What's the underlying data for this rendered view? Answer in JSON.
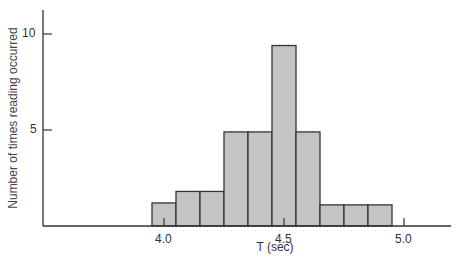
{
  "chart_data": {
    "type": "bar",
    "subtype": "histogram",
    "title": "",
    "xlabel": "T (sec)",
    "ylabel": "Number of times reading occurred",
    "x_ticks": [
      "4.0",
      "4.5",
      "5.0"
    ],
    "x_tick_values": [
      4.0,
      4.5,
      5.0
    ],
    "y_ticks": [
      "5",
      "10"
    ],
    "y_tick_values": [
      5,
      10
    ],
    "xlim": [
      3.45,
      5.2
    ],
    "ylim": [
      0,
      11.5
    ],
    "grid": false,
    "legend": null,
    "bin_width": 0.1,
    "categories": [
      "3.95-4.05",
      "4.05-4.15",
      "4.15-4.25",
      "4.25-4.35",
      "4.35-4.45",
      "4.45-4.55",
      "4.55-4.65",
      "4.65-4.75",
      "4.75-4.85",
      "4.85-4.95"
    ],
    "bin_starts": [
      3.95,
      4.05,
      4.15,
      4.25,
      4.35,
      4.45,
      4.55,
      4.65,
      4.75,
      4.85
    ],
    "values": [
      1.2,
      1.8,
      1.8,
      4.9,
      4.9,
      9.4,
      4.9,
      1.1,
      1.1,
      1.1
    ],
    "bar_color": "#c4c4c4",
    "edge_color": "#333333"
  },
  "labels": {
    "ylabel": "Number of times reading occurred",
    "xlabel": "T (sec)",
    "y10": "10",
    "y5": "5",
    "x40": "4.0",
    "x45": "4.5",
    "x50": "5.0"
  }
}
